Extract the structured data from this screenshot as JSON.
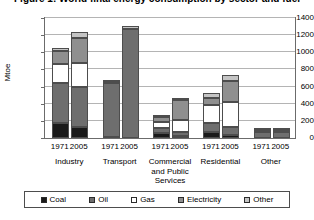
{
  "chart_data": {
    "type": "bar",
    "stacked": true,
    "title": "Figure 1: World final energy consumption by sector and fuel",
    "xlabel": "",
    "ylabel": "Mtoe",
    "ylim": [
      0,
      1400
    ],
    "yticks": [
      0,
      200,
      400,
      600,
      800,
      1000,
      1200,
      1400
    ],
    "grid": true,
    "legend_position": "bottom",
    "groups": [
      "Industry",
      "Transport",
      "Commercial and Public Services",
      "Residential",
      "Other"
    ],
    "categories": [
      "1971",
      "2005",
      "1971",
      "2005",
      "1971",
      "2005",
      "1971",
      "2005",
      "1971",
      "2005"
    ],
    "series": [
      {
        "name": "Coal",
        "color": "#1a1a1a",
        "values": [
          180,
          130,
          10,
          5,
          60,
          20,
          70,
          30,
          5,
          5
        ]
      },
      {
        "name": "Oil",
        "color": "#6e6e6e",
        "values": [
          460,
          470,
          635,
          1265,
          60,
          50,
          110,
          100,
          70,
          65
        ]
      },
      {
        "name": "Gas",
        "color": "#ffffff",
        "values": [
          220,
          280,
          0,
          0,
          70,
          140,
          200,
          290,
          5,
          5
        ]
      },
      {
        "name": "Electricity",
        "color": "#8f8f8f",
        "values": [
          160,
          290,
          5,
          5,
          50,
          230,
          90,
          240,
          10,
          15
        ]
      },
      {
        "name": "Other",
        "color": "#c4c4c4",
        "values": [
          30,
          70,
          5,
          35,
          10,
          20,
          50,
          70,
          5,
          5
        ]
      }
    ],
    "totals": [
      1050,
      1240,
      655,
      1310,
      250,
      460,
      520,
      730,
      95,
      95
    ]
  },
  "legend": {
    "items": [
      {
        "label": "Coal"
      },
      {
        "label": "Oil"
      },
      {
        "label": "Gas"
      },
      {
        "label": "Electricity"
      },
      {
        "label": "Other"
      }
    ]
  }
}
